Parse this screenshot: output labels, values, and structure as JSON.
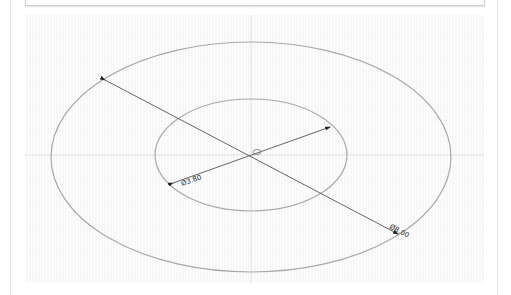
{
  "diagram": {
    "type": "concentric-circles-sketch",
    "colors": {
      "canvas_bg": "#f7f7f7",
      "circle_stroke": "#a8a8a8",
      "dimension_line": "#555555",
      "axis_line": "#e2e2e2"
    },
    "center": {
      "x": 251,
      "y": 155
    },
    "outer_circle": {
      "rx": 200,
      "ry": 115,
      "label": "Ø8.00"
    },
    "inner_circle": {
      "rx": 96,
      "ry": 56,
      "label": "Ø3.80"
    },
    "dimensions": [
      {
        "name": "outer-diameter",
        "text": "Ø8.00"
      },
      {
        "name": "inner-diameter",
        "text": "Ø3.80"
      }
    ]
  }
}
